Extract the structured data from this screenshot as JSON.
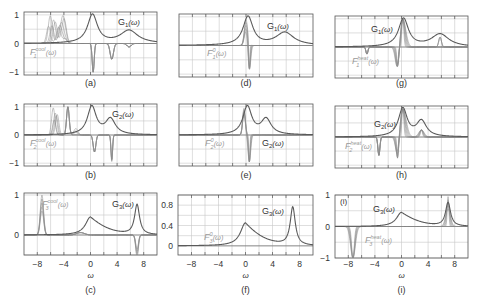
{
  "figure": {
    "colors": {
      "frame": "#555555",
      "grid": "#c8c8c8",
      "G": "#5a5a5a",
      "F": "#8a8a8a",
      "text": "#333333",
      "flabel": "#9a9a9a"
    }
  },
  "chart_data": [
    {
      "id": "a",
      "type": "line",
      "caption": "(a)",
      "panel": {
        "x": 24,
        "y": 12,
        "w": 133,
        "h": 63
      },
      "xlim": [
        -10,
        10
      ],
      "ylim": [
        -1.1,
        1.1
      ],
      "yticks": [
        1,
        0,
        -1
      ],
      "ytick_labels": [
        "1",
        "0",
        "−1"
      ],
      "xticks": [
        -8,
        -4,
        0,
        4,
        8
      ],
      "xtick_labels": [],
      "show_xlabel": false,
      "g_label": "G",
      "g_sub": "1",
      "g_arg": "(ω)",
      "g_label_pos": [
        118,
        25
      ],
      "f_label": "F",
      "f_sub": "1",
      "f_sup": "cool",
      "f_arg": "(ω)",
      "f_label_pos": [
        30,
        55
      ],
      "G_peaks": [
        {
          "x0": 0.3,
          "w": 0.9,
          "a": 1.0
        },
        {
          "x0": 5.8,
          "w": 1.6,
          "a": 0.45
        }
      ],
      "F_series": "cool1"
    },
    {
      "id": "b",
      "type": "line",
      "caption": "(b)",
      "panel": {
        "x": 24,
        "y": 104,
        "w": 133,
        "h": 62
      },
      "xlim": [
        -10,
        10
      ],
      "ylim": [
        -1.1,
        1.1
      ],
      "yticks": [
        1,
        0,
        -1
      ],
      "ytick_labels": [
        "1",
        "0",
        "−1"
      ],
      "xticks": [
        -8,
        -4,
        0,
        4,
        8
      ],
      "xtick_labels": [],
      "show_xlabel": false,
      "g_label": "G",
      "g_sub": "2",
      "g_arg": "(ω)",
      "g_label_pos": [
        112,
        117
      ],
      "f_label": "F",
      "f_sub": "2",
      "f_sup": "cool",
      "f_arg": "(ω)",
      "f_label_pos": [
        30,
        146
      ],
      "G_peaks": [
        {
          "x0": 0.2,
          "w": 0.8,
          "a": 1.0
        },
        {
          "x0": 3.0,
          "w": 0.9,
          "a": 0.55
        }
      ],
      "F_series": "cool2"
    },
    {
      "id": "c",
      "type": "line",
      "caption": "(c)",
      "panel": {
        "x": 24,
        "y": 193,
        "w": 133,
        "h": 62
      },
      "xlim": [
        -10,
        10
      ],
      "ylim": [
        -0.5,
        1.05
      ],
      "yticks": [
        1,
        0
      ],
      "ytick_labels": [
        "1",
        "0"
      ],
      "xticks": [
        -8,
        -4,
        0,
        4,
        8
      ],
      "xtick_labels": [
        "−8",
        "−4",
        "0",
        "4",
        "8"
      ],
      "show_xlabel": true,
      "xlabel": "ω",
      "g_label": "G",
      "g_sub": "3",
      "g_arg": "(ω)",
      "g_label_pos": [
        112,
        207
      ],
      "f_label": "F",
      "f_sub": "3",
      "f_sup": "cool",
      "f_arg": "(ω)",
      "f_label_pos": [
        42,
        207
      ],
      "G_series": "G3",
      "F_series": "cool3"
    },
    {
      "id": "d",
      "type": "line",
      "caption": "(d)",
      "panel": {
        "x": 179,
        "y": 14,
        "w": 134,
        "h": 63
      },
      "xlim": [
        -10,
        10
      ],
      "ylim": [
        -1.1,
        1.1
      ],
      "yticks": [],
      "ytick_labels": [],
      "xticks": [
        -8,
        -4,
        0,
        4,
        8
      ],
      "xtick_labels": [],
      "show_xlabel": false,
      "g_label": "G",
      "g_sub": "1",
      "g_arg": "(ω)",
      "g_label_pos": [
        267,
        29
      ],
      "f_label": "F",
      "f_sub": "1",
      "f_sup": "0",
      "f_arg": "(ω)",
      "f_label_pos": [
        207,
        56
      ],
      "G_peaks": [
        {
          "x0": 0.3,
          "w": 0.9,
          "a": 1.0
        },
        {
          "x0": 5.8,
          "w": 1.6,
          "a": 0.45
        }
      ],
      "F_series": "zero1"
    },
    {
      "id": "e",
      "type": "line",
      "caption": "(e)",
      "panel": {
        "x": 179,
        "y": 104,
        "w": 134,
        "h": 62
      },
      "xlim": [
        -10,
        10
      ],
      "ylim": [
        -1.1,
        1.1
      ],
      "yticks": [],
      "ytick_labels": [],
      "xticks": [
        -8,
        -4,
        0,
        4,
        8
      ],
      "xtick_labels": [],
      "show_xlabel": false,
      "g_label": "G",
      "g_sub": "2",
      "g_arg": "(ω)",
      "g_label_pos": [
        262,
        146
      ],
      "f_label": "F",
      "f_sub": "2",
      "f_sup": "0",
      "f_arg": "(ω)",
      "f_label_pos": [
        205,
        146
      ],
      "G_peaks": [
        {
          "x0": 0.2,
          "w": 0.8,
          "a": 1.0
        },
        {
          "x0": 3.0,
          "w": 0.9,
          "a": 0.55
        }
      ],
      "F_series": "zero2"
    },
    {
      "id": "f",
      "type": "line",
      "caption": "(f)",
      "panel": {
        "x": 178,
        "y": 195,
        "w": 135,
        "h": 60
      },
      "xlim": [
        -10,
        10
      ],
      "ylim": [
        -0.18,
        1.0
      ],
      "yticks": [
        0.8,
        0.4,
        0
      ],
      "ytick_labels": [
        "0.8",
        "0.4",
        "0"
      ],
      "xticks": [
        -8,
        -4,
        0,
        4,
        8
      ],
      "xtick_labels": [
        "−8",
        "−4",
        "0",
        "4",
        "8"
      ],
      "show_xlabel": true,
      "xlabel": "ω",
      "g_label": "G",
      "g_sub": "3",
      "g_arg": "(ω)",
      "g_label_pos": [
        262,
        214
      ],
      "f_label": "F",
      "f_sub": "3",
      "f_sup": "0",
      "f_arg": "(ω)",
      "f_label_pos": [
        204,
        240
      ],
      "G_series": "G3",
      "F_series": "none"
    },
    {
      "id": "g",
      "type": "line",
      "caption": "(g)",
      "panel": {
        "x": 335,
        "y": 16,
        "w": 133,
        "h": 62
      },
      "xlim": [
        -10,
        10
      ],
      "ylim": [
        -1.1,
        1.1
      ],
      "yticks": [],
      "ytick_labels": [],
      "xticks": [
        -8,
        -4,
        0,
        4,
        8
      ],
      "xtick_labels": [],
      "show_xlabel": false,
      "g_label": "G",
      "g_sub": "1",
      "g_arg": "(ω)",
      "g_label_pos": [
        371,
        32
      ],
      "f_label": "F",
      "f_sub": "1",
      "f_sup": "heat",
      "f_arg": "(ω)",
      "f_label_pos": [
        352,
        64
      ],
      "G_peaks": [
        {
          "x0": 0.3,
          "w": 0.9,
          "a": 1.0
        },
        {
          "x0": 5.8,
          "w": 1.6,
          "a": 0.45
        }
      ],
      "F_series": "heat1"
    },
    {
      "id": "h",
      "type": "line",
      "caption": "(h)",
      "panel": {
        "x": 335,
        "y": 106,
        "w": 133,
        "h": 62
      },
      "xlim": [
        -10,
        10
      ],
      "ylim": [
        -1.1,
        1.1
      ],
      "yticks": [],
      "ytick_labels": [],
      "xticks": [
        -8,
        -4,
        0,
        4,
        8
      ],
      "xtick_labels": [],
      "show_xlabel": false,
      "g_label": "G",
      "g_sub": "2",
      "g_arg": "(ω)",
      "g_label_pos": [
        374,
        127
      ],
      "f_label": "F",
      "f_sub": "2",
      "f_sup": "heat",
      "f_arg": "(ω)",
      "f_label_pos": [
        345,
        149
      ],
      "G_peaks": [
        {
          "x0": 0.2,
          "w": 0.8,
          "a": 1.0
        },
        {
          "x0": 3.0,
          "w": 0.9,
          "a": 0.55
        }
      ],
      "F_series": "heat2"
    },
    {
      "id": "i",
      "type": "line",
      "caption": "(i)",
      "panel": {
        "x": 335,
        "y": 195,
        "w": 133,
        "h": 63
      },
      "xlim": [
        -10,
        10
      ],
      "ylim": [
        -1.0,
        1.0
      ],
      "yticks": [
        1,
        0,
        -1
      ],
      "ytick_labels": [
        "1",
        "0",
        "−1"
      ],
      "xticks": [
        -8,
        -4,
        0,
        4,
        8
      ],
      "xtick_labels": [
        "−8",
        "−4",
        "0",
        "4",
        "8"
      ],
      "show_xlabel": true,
      "xlabel": "ω",
      "g_label": "G",
      "g_sub": "3",
      "g_arg": "(ω)",
      "g_label_pos": [
        373,
        212
      ],
      "f_label": "F",
      "f_sub": "3",
      "f_sup": "heat",
      "f_arg": "(ω)",
      "f_label_pos": [
        365,
        243
      ],
      "inner_label": "(i)",
      "inner_label_pos": [
        340,
        204
      ],
      "G_series": "G3",
      "F_series": "heat3"
    }
  ],
  "captions_y": {
    "row1": 86,
    "row2": 178,
    "row3": 293
  },
  "xlabel_y": 278,
  "xtick_label_y": 267
}
